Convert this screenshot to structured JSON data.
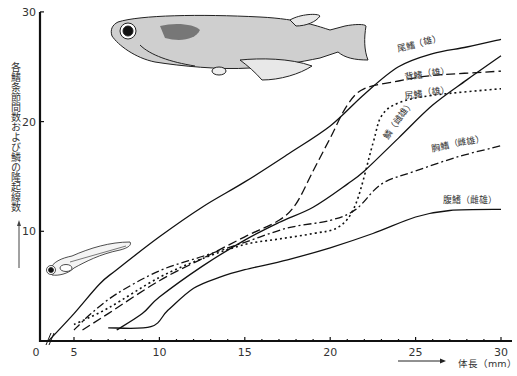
{
  "chart_data": {
    "type": "line",
    "title": "",
    "xlabel": "体長（mm）",
    "ylabel": "各鰭条節間数および鱗の隆起線数",
    "xlim": [
      0,
      30
    ],
    "ylim": [
      0,
      30
    ],
    "x_ticks": [
      "0",
      "5",
      "10",
      "15",
      "20",
      "25",
      "30"
    ],
    "y_ticks": [
      "0",
      "10",
      "20",
      "30"
    ],
    "grid": false,
    "legend": "inline labels near line ends",
    "axis_break": "x-axis broken between 0 and 5",
    "series": [
      {
        "name": "尾鰭（雄）",
        "style": "solid",
        "x": [
          3.5,
          5,
          6.5,
          7.5,
          10,
          12.5,
          15,
          17.5,
          20,
          22,
          24,
          26,
          28,
          30
        ],
        "y": [
          0,
          2.5,
          5.2,
          6.5,
          9.5,
          12.2,
          14.5,
          17,
          19.6,
          22.5,
          25,
          26.2,
          26.8,
          27.5
        ]
      },
      {
        "name": "背鰭（雄）",
        "style": "dashed",
        "x": [
          5.5,
          7,
          10,
          12.5,
          15,
          17,
          18,
          19,
          20,
          21,
          22,
          24,
          26,
          30
        ],
        "y": [
          1,
          2.5,
          5.5,
          7.5,
          9.5,
          11,
          12.5,
          15.5,
          18.5,
          21.5,
          23,
          23.7,
          24.2,
          24.6
        ]
      },
      {
        "name": "尻鰭（雄）",
        "style": "dotted",
        "x": [
          5,
          7,
          10,
          12.5,
          15,
          17,
          19,
          20.5,
          21.5,
          22.5,
          23,
          24,
          26,
          30
        ],
        "y": [
          1.5,
          3,
          5.8,
          7.5,
          8.8,
          9.3,
          9.8,
          10.4,
          12.5,
          18,
          20.5,
          21.7,
          22.4,
          23
        ]
      },
      {
        "name": "鱗（雌雄）",
        "style": "solid",
        "x": [
          7.5,
          9,
          10,
          12.5,
          15,
          17,
          19,
          21,
          22,
          24,
          26,
          28,
          30
        ],
        "y": [
          1,
          2.5,
          4,
          6.8,
          9.2,
          10.8,
          12.2,
          14.3,
          15.5,
          18.5,
          21.5,
          23.8,
          26
        ]
      },
      {
        "name": "胸鰭（雌雄）",
        "style": "dashdot",
        "x": [
          5,
          6,
          7.5,
          10,
          12.5,
          15,
          17.5,
          20,
          21.5,
          23,
          25,
          27.5,
          30
        ],
        "y": [
          1,
          2.5,
          4.3,
          6.4,
          7.7,
          9,
          10.3,
          11,
          12,
          14.3,
          15.5,
          16.8,
          17.8
        ]
      },
      {
        "name": "腹鰭（雌雄）",
        "style": "solid",
        "x": [
          7,
          9.5,
          10.5,
          12,
          13.5,
          15,
          17.5,
          20,
          22.5,
          25,
          27,
          30
        ],
        "y": [
          1.2,
          1.3,
          2.8,
          4.8,
          5.8,
          6.5,
          7.4,
          8.5,
          9.8,
          11.3,
          11.9,
          12
        ]
      }
    ]
  },
  "labels": {
    "ylabel": "各鰭条節間数および鱗の隆起線数",
    "xlabel": "体長（mm）",
    "series_labels": [
      "尾鰭（雄）",
      "背鰭（雄）",
      "尻鰭（雄）",
      "鱗（雌雄）",
      "胸鰭（雌雄）",
      "腹鰭（雌雄）"
    ]
  },
  "illustrations": {
    "adult_fish": "medaka adult illustration",
    "larva": "medaka larva illustration"
  }
}
